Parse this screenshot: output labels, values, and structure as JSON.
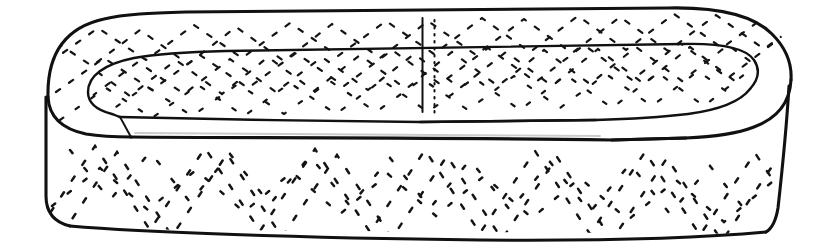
{
  "figure": {
    "kind": "line-drawing",
    "background_color": "#ffffff",
    "ink_color": "#111111",
    "hatch_color": "#141414",
    "width": 834,
    "height": 250,
    "title": "",
    "caption": ""
  },
  "parts": [
    {
      "id": "outer-rim-top",
      "label": "Outer rim upper edge",
      "stroke": "#111111",
      "stroke_width": 3.1,
      "style": "solid"
    },
    {
      "id": "inner-rim-edge",
      "label": "Inner rim edge",
      "stroke": "#111111",
      "stroke_width": 2.4,
      "style": "solid"
    },
    {
      "id": "inner-floor-edge",
      "label": "Inner floor edge",
      "stroke": "#111111",
      "stroke_width": 2.4,
      "style": "solid"
    },
    {
      "id": "outer-wall",
      "label": "Outer side wall",
      "stroke": "#111111",
      "stroke_width": 3.1,
      "style": "solid"
    },
    {
      "id": "bottom-edge",
      "label": "Bottom edge",
      "stroke": "#111111",
      "stroke_width": 3.1,
      "style": "solid"
    },
    {
      "id": "center-solid-rule",
      "label": "Centre vertical rule",
      "stroke": "#111111",
      "stroke_width": 2.0,
      "style": "solid"
    },
    {
      "id": "center-dotted-rule",
      "label": "Centre dotted vertical rule",
      "stroke": "#111111",
      "stroke_width": 2.0,
      "style": "dotted"
    }
  ],
  "hatching": {
    "style": "short dashed chevron strokes",
    "regions": [
      {
        "id": "rim-band-hatch",
        "label": "Rim band chevron hatching",
        "chevron_period_px": 96,
        "amplitude_px": 24,
        "dash": "5 11"
      },
      {
        "id": "inner-wall-hatch",
        "label": "Inner wall chevron hatching",
        "chevron_period_px": 96,
        "amplitude_px": 22,
        "dash": "5 11"
      },
      {
        "id": "outer-wall-hatch",
        "label": "Outer wall chevron hatching",
        "chevron_period_px": 110,
        "amplitude_px": 72,
        "dash": "5 14"
      }
    ]
  }
}
